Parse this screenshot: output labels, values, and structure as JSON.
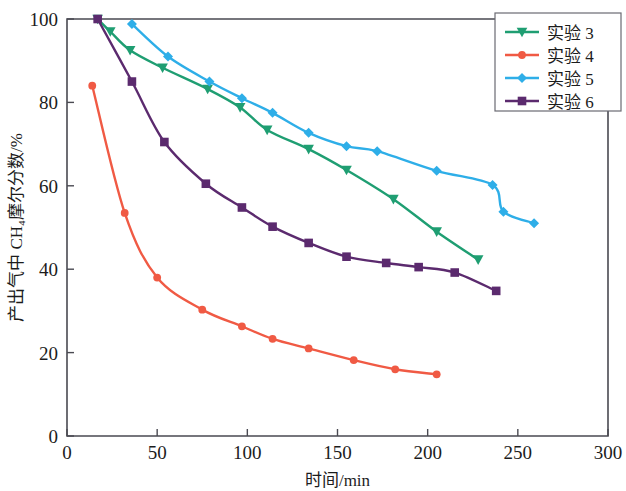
{
  "chart_data": {
    "type": "line",
    "title": "",
    "xlabel": "时间/min",
    "ylabel": "产出气中 CH₄摩尔分数/%",
    "xlim": [
      0,
      300
    ],
    "ylim": [
      0,
      100
    ],
    "xticks": [
      0,
      50,
      100,
      150,
      200,
      250,
      300
    ],
    "yticks": [
      0,
      20,
      40,
      60,
      80,
      100
    ],
    "grid": false,
    "legend_position": "top-right",
    "series": [
      {
        "name": "实验 3",
        "color": "#1f9e72",
        "marker": "triangle",
        "points": [
          [
            17,
            100.0
          ],
          [
            24,
            97.0
          ],
          [
            35,
            92.5
          ],
          [
            53,
            88.3
          ],
          [
            78,
            83.2
          ],
          [
            96,
            78.8
          ],
          [
            111,
            73.4
          ],
          [
            134,
            68.8
          ],
          [
            155,
            63.8
          ],
          [
            181,
            56.8
          ],
          [
            205,
            49.0
          ],
          [
            228,
            42.3
          ]
        ]
      },
      {
        "name": "实验 4",
        "color": "#f05a44",
        "marker": "circle",
        "points": [
          [
            14,
            84.0
          ],
          [
            32,
            53.5
          ],
          [
            50,
            38.0
          ],
          [
            75,
            30.3
          ],
          [
            97,
            26.3
          ],
          [
            114,
            23.3
          ],
          [
            134,
            21.0
          ],
          [
            159,
            18.2
          ],
          [
            182,
            16.0
          ],
          [
            205,
            14.8
          ]
        ]
      },
      {
        "name": "实验 5",
        "color": "#2eaee8",
        "marker": "diamond",
        "points": [
          [
            36,
            98.8
          ],
          [
            56,
            91.0
          ],
          [
            79,
            85.0
          ],
          [
            97,
            81.0
          ],
          [
            114,
            77.5
          ],
          [
            134,
            72.7
          ],
          [
            155,
            69.5
          ],
          [
            172,
            68.3
          ],
          [
            205,
            63.6
          ],
          [
            236,
            60.2
          ],
          [
            242,
            53.8
          ],
          [
            259,
            51.0
          ]
        ]
      },
      {
        "name": "实验 6",
        "color": "#5b2a6e",
        "marker": "square",
        "points": [
          [
            17,
            100.0
          ],
          [
            36,
            85.0
          ],
          [
            54,
            70.5
          ],
          [
            77,
            60.5
          ],
          [
            97,
            54.8
          ],
          [
            114,
            50.2
          ],
          [
            134,
            46.3
          ],
          [
            155,
            43.0
          ],
          [
            177,
            41.5
          ],
          [
            195,
            40.5
          ],
          [
            215,
            39.2
          ],
          [
            238,
            34.8
          ]
        ]
      }
    ]
  },
  "legend": {
    "entries": [
      {
        "label": "实验 3"
      },
      {
        "label": "实验 4"
      },
      {
        "label": "实验 5"
      },
      {
        "label": "实验 6"
      }
    ]
  },
  "axes": {
    "x_tick_labels": [
      "0",
      "50",
      "100",
      "150",
      "200",
      "250",
      "300"
    ],
    "y_tick_labels": [
      "0",
      "20",
      "40",
      "60",
      "80",
      "100"
    ],
    "x_title": "时间/min",
    "y_title": "产出气中 CH₄摩尔分数/%"
  }
}
